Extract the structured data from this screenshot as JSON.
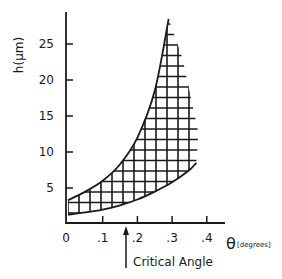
{
  "chart_data": {
    "type": "area",
    "title": "",
    "xlabel": "θ [degrees]",
    "xlabel_symbol": "θ",
    "xlabel_unit": "[degrees]",
    "ylabel": "h(μm)",
    "xlim": [
      0,
      0.45
    ],
    "ylim": [
      0,
      30
    ],
    "x_ticks": [
      0,
      0.1,
      0.2,
      0.3,
      0.4
    ],
    "x_tick_labels": [
      "0",
      ".1",
      ".2",
      ".3",
      ".4"
    ],
    "y_ticks": [
      5,
      10,
      15,
      20,
      25
    ],
    "y_tick_labels": [
      "5",
      "10",
      "15",
      "20",
      "25"
    ],
    "grid": false,
    "fill": "cross-hatched region between curves",
    "series": [
      {
        "name": "upper bound",
        "x": [
          0,
          0.05,
          0.1,
          0.15,
          0.2,
          0.25,
          0.29
        ],
        "y": [
          3.3,
          4.5,
          6.0,
          8.3,
          12.0,
          18.5,
          28.5
        ]
      },
      {
        "name": "lower bound",
        "x": [
          0,
          0.05,
          0.1,
          0.15,
          0.2,
          0.25,
          0.3,
          0.35,
          0.37
        ],
        "y": [
          1.3,
          1.6,
          2.0,
          2.6,
          3.4,
          4.5,
          5.8,
          7.5,
          8.5
        ]
      }
    ],
    "right_edge": {
      "x_start": 0.29,
      "x_end": 0.37,
      "note": "hatch lines extend to stepped right boundary"
    },
    "annotations": [
      {
        "text": "Critical Angle",
        "x": 0.17,
        "arrow": "up",
        "points_to_y": 0
      }
    ]
  },
  "labels": {
    "ylabel": "h(μm)",
    "theta": "θ",
    "degrees": "[degrees]",
    "critical_angle": "Critical Angle"
  }
}
